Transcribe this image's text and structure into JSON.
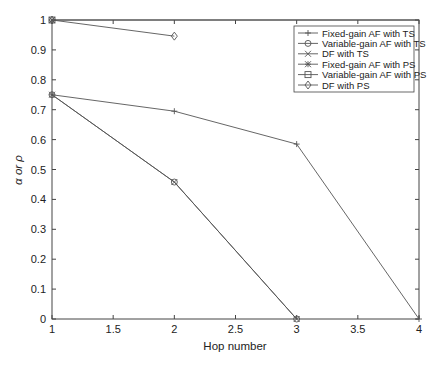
{
  "chart_data": {
    "type": "line",
    "title": "",
    "xlabel": "Hop number",
    "ylabel": "α or ρ",
    "xlim": [
      1,
      4
    ],
    "ylim": [
      0,
      1
    ],
    "grid": false,
    "legend_position": "upper right",
    "x_ticks": [
      "1",
      "1.5",
      "2",
      "2.5",
      "3",
      "3.5",
      "4"
    ],
    "y_ticks": [
      "0",
      "0.1",
      "0.2",
      "0.3",
      "0.4",
      "0.5",
      "0.6",
      "0.7",
      "0.8",
      "0.9",
      "1"
    ],
    "series": [
      {
        "name": "Fixed-gain AF with TS",
        "marker": "plus",
        "x": [
          1,
          2,
          3,
          4
        ],
        "values": [
          0.75,
          0.695,
          0.585,
          0
        ]
      },
      {
        "name": "Variable-gain AF with TS",
        "marker": "circle",
        "x": [
          1,
          2,
          3
        ],
        "values": [
          0.75,
          0.458,
          0
        ]
      },
      {
        "name": "DF with TS",
        "marker": "x",
        "x": [
          1,
          2,
          3
        ],
        "values": [
          0.75,
          0.458,
          0
        ]
      },
      {
        "name": "Fixed-gain AF with PS",
        "marker": "star",
        "x": [
          1
        ],
        "values": [
          1.0
        ]
      },
      {
        "name": "Variable-gain AF with PS",
        "marker": "square",
        "x": [
          1
        ],
        "values": [
          1.0
        ]
      },
      {
        "name": "DF with PS",
        "marker": "diamond",
        "x": [
          1,
          2
        ],
        "values": [
          1.0,
          0.946
        ]
      }
    ]
  },
  "colors": {
    "line": "#555555",
    "axis": "#444444",
    "text": "#222222",
    "background": "#ffffff"
  }
}
